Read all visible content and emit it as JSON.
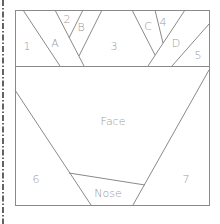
{
  "diagram": {
    "sections": {
      "top": {
        "pieces": [
          {
            "id": "1",
            "label": "1",
            "x": 27,
            "y": 46
          },
          {
            "id": "A",
            "label": "A",
            "x": 54,
            "y": 44
          },
          {
            "id": "2",
            "label": "2",
            "x": 66,
            "y": 20
          },
          {
            "id": "B",
            "label": "B",
            "x": 80,
            "y": 28
          },
          {
            "id": "3",
            "label": "3",
            "x": 113,
            "y": 46
          },
          {
            "id": "C",
            "label": "C",
            "x": 147,
            "y": 27
          },
          {
            "id": "4",
            "label": "4",
            "x": 162,
            "y": 23
          },
          {
            "id": "D",
            "label": "D",
            "x": 175,
            "y": 44
          },
          {
            "id": "5",
            "label": "5",
            "x": 197,
            "y": 56
          }
        ]
      },
      "bottom": {
        "pieces": [
          {
            "id": "Face",
            "label": "Face",
            "x": 112,
            "y": 122
          },
          {
            "id": "6",
            "label": "6",
            "x": 35,
            "y": 180
          },
          {
            "id": "Nose",
            "label": "Nose",
            "x": 107,
            "y": 194
          },
          {
            "id": "7",
            "label": "7",
            "x": 185,
            "y": 180
          }
        ]
      }
    },
    "line_color": "#8a8a8a",
    "label_color": "#9a9a9a",
    "cut_line_color": "#222222"
  }
}
